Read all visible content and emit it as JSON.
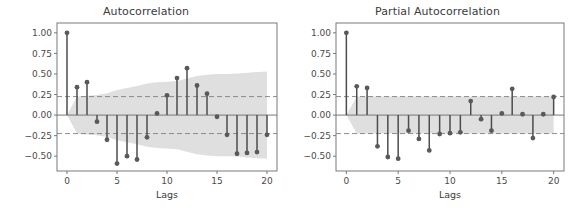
{
  "figure": {
    "background_color": "#ffffff",
    "width": 583,
    "height": 216
  },
  "style": {
    "stem_color": "#4c4c4c",
    "marker_color": "#595959",
    "band_color": "#d9d9d9",
    "conf_line_color": "#7f7f7f",
    "axis_color": "#6b6b6b",
    "text_color": "#3b3b3b"
  },
  "panels": [
    {
      "id": "acf",
      "title": "Autocorrelation"
    },
    {
      "id": "pacf",
      "title": "Partial Autocorrelation"
    }
  ],
  "chart_data": [
    {
      "type": "stem",
      "id": "acf",
      "title": "Autocorrelation",
      "xlabel": "Lags",
      "ylabel": "",
      "grid": false,
      "legend": "none",
      "xlim": [
        -1.0,
        21.0
      ],
      "ylim": [
        -0.68,
        1.12
      ],
      "xticks": [
        0,
        5,
        10,
        15,
        20
      ],
      "xtick_labels": [
        "0",
        "5",
        "10",
        "15",
        "20"
      ],
      "yticks": [
        -0.5,
        -0.25,
        0.0,
        0.25,
        0.5,
        0.75,
        1.0
      ],
      "ytick_labels": [
        "-0.50",
        "-0.25",
        "0.00",
        "0.25",
        "0.50",
        "0.75",
        "1.00"
      ],
      "x": [
        0,
        1,
        2,
        3,
        4,
        5,
        6,
        7,
        8,
        9,
        10,
        11,
        12,
        13,
        14,
        15,
        16,
        17,
        18,
        19,
        20
      ],
      "values": [
        1.0,
        0.34,
        0.4,
        -0.08,
        -0.3,
        -0.59,
        -0.5,
        -0.54,
        -0.27,
        0.02,
        0.24,
        0.45,
        0.57,
        0.36,
        0.26,
        -0.02,
        -0.24,
        -0.47,
        -0.46,
        -0.45,
        -0.24
      ],
      "conf_lines": [
        0.225,
        -0.225
      ],
      "conf_band_upper": [
        0.0,
        0.225,
        0.235,
        0.245,
        0.265,
        0.305,
        0.33,
        0.355,
        0.385,
        0.4,
        0.405,
        0.415,
        0.445,
        0.475,
        0.49,
        0.5,
        0.5,
        0.505,
        0.515,
        0.525,
        0.53
      ],
      "conf_band_lower": [
        0.0,
        -0.225,
        -0.235,
        -0.245,
        -0.265,
        -0.305,
        -0.33,
        -0.355,
        -0.385,
        -0.4,
        -0.405,
        -0.415,
        -0.445,
        -0.475,
        -0.49,
        -0.5,
        -0.5,
        -0.505,
        -0.515,
        -0.525,
        -0.53
      ]
    },
    {
      "type": "stem",
      "id": "pacf",
      "title": "Partial Autocorrelation",
      "xlabel": "Lags",
      "ylabel": "",
      "grid": false,
      "legend": "none",
      "xlim": [
        -1.0,
        21.0
      ],
      "ylim": [
        -0.68,
        1.12
      ],
      "xticks": [
        0,
        5,
        10,
        15,
        20
      ],
      "xtick_labels": [
        "0",
        "5",
        "10",
        "15",
        "20"
      ],
      "yticks": [
        -0.5,
        -0.25,
        0.0,
        0.25,
        0.5,
        0.75,
        1.0
      ],
      "ytick_labels": [
        "-0.50",
        "-0.25",
        "0.00",
        "0.25",
        "0.50",
        "0.75",
        "1.00"
      ],
      "x": [
        0,
        1,
        2,
        3,
        4,
        5,
        6,
        7,
        8,
        9,
        10,
        11,
        12,
        13,
        14,
        15,
        16,
        17,
        18,
        19,
        20
      ],
      "values": [
        1.0,
        0.35,
        0.33,
        -0.38,
        -0.51,
        -0.53,
        -0.19,
        -0.29,
        -0.43,
        -0.23,
        -0.22,
        -0.21,
        0.17,
        -0.05,
        -0.19,
        0.02,
        0.32,
        0.01,
        -0.28,
        0.01,
        0.22
      ],
      "conf_lines": [
        0.225,
        -0.225
      ],
      "conf_band_upper": [
        0.0,
        0.225,
        0.225,
        0.225,
        0.225,
        0.225,
        0.225,
        0.225,
        0.225,
        0.225,
        0.225,
        0.225,
        0.225,
        0.225,
        0.225,
        0.225,
        0.225,
        0.225,
        0.225,
        0.225,
        0.225
      ],
      "conf_band_lower": [
        0.0,
        -0.225,
        -0.225,
        -0.225,
        -0.225,
        -0.225,
        -0.225,
        -0.225,
        -0.225,
        -0.225,
        -0.225,
        -0.225,
        -0.225,
        -0.225,
        -0.225,
        -0.225,
        -0.225,
        -0.225,
        -0.225,
        -0.225,
        -0.225
      ]
    }
  ]
}
